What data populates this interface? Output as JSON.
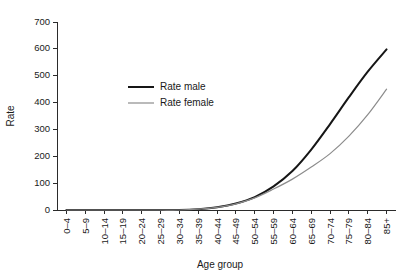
{
  "chart_data": {
    "type": "line",
    "title": "",
    "xlabel": "Age group",
    "ylabel": "Rate",
    "categories": [
      "0–4",
      "5–9",
      "10–14",
      "15–19",
      "20–24",
      "25–29",
      "30–34",
      "35–39",
      "40–44",
      "45–49",
      "50–54",
      "55–59",
      "60–64",
      "65–69",
      "70–74",
      "75–79",
      "80–84",
      "85+"
    ],
    "series": [
      {
        "name": "Rate male",
        "color": "#161616",
        "width": 2.0,
        "values": [
          0,
          0,
          0,
          0,
          0,
          0,
          0,
          3,
          10,
          24,
          48,
          88,
          145,
          225,
          320,
          420,
          515,
          598
        ]
      },
      {
        "name": "Rate female",
        "color": "#8c8c8c",
        "width": 1.2,
        "values": [
          0,
          0,
          0,
          0,
          0,
          0,
          0,
          3,
          10,
          23,
          45,
          78,
          115,
          160,
          210,
          275,
          355,
          450
        ]
      }
    ],
    "ylim": [
      0,
      700
    ],
    "yticks": [
      0,
      100,
      200,
      300,
      400,
      500,
      600,
      700
    ],
    "ytick_labels": [
      "0",
      "100",
      "200",
      "300",
      "400",
      "500",
      "600",
      "700"
    ],
    "grid": false,
    "legend_position": "upper-left-inside"
  },
  "legend": {
    "entries": [
      {
        "label": "Rate male"
      },
      {
        "label": "Rate female"
      }
    ]
  }
}
